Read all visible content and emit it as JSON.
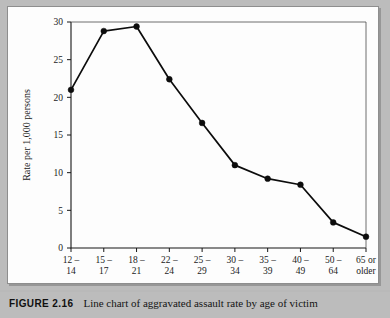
{
  "figure": {
    "label": "FIGURE 2.16",
    "caption": "Line chart of aggravated assault rate by age of victim"
  },
  "chart_data": {
    "type": "line",
    "title": "",
    "xlabel": "Age of victim",
    "ylabel": "Rate per 1,000 persons",
    "categories": [
      "12 –\n14",
      "15 –\n17",
      "18 –\n21",
      "22 –\n24",
      "25 –\n29",
      "30 –\n34",
      "35 –\n39",
      "40 –\n49",
      "50 –\n64",
      "65 or\nolder"
    ],
    "category_lines": [
      [
        "12 –",
        "14"
      ],
      [
        "15 –",
        "17"
      ],
      [
        "18 –",
        "21"
      ],
      [
        "22 –",
        "24"
      ],
      [
        "25 –",
        "29"
      ],
      [
        "30 –",
        "34"
      ],
      [
        "35 –",
        "39"
      ],
      [
        "40 –",
        "49"
      ],
      [
        "50 –",
        "64"
      ],
      [
        "65 or",
        "older"
      ]
    ],
    "values": [
      21.0,
      28.8,
      29.4,
      22.4,
      16.6,
      11.0,
      9.2,
      8.4,
      3.4,
      1.5
    ],
    "ylim": [
      0,
      30
    ],
    "yticks": [
      0,
      5,
      10,
      15,
      20,
      25,
      30
    ],
    "ytick_labels": [
      "0",
      "5",
      "10",
      "15",
      "20",
      "25",
      "30"
    ],
    "grid": false,
    "legend": null,
    "marker": "filled-circle",
    "series_color": "#0c0c0c"
  },
  "colors": {
    "page_background": "#bcbcbc",
    "panel_background": "#fdfdfd",
    "panel_border": "#8e8e8e",
    "axis": "#171717",
    "text": "#1b1b1b"
  }
}
